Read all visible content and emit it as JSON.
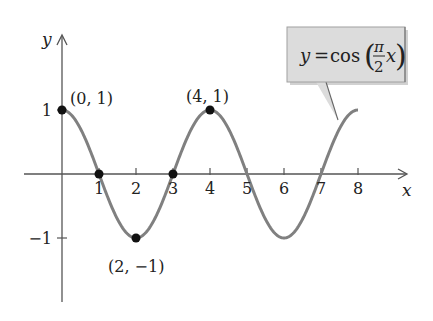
{
  "chart_data": {
    "type": "line",
    "title": "",
    "function_label": {
      "lhs": "y",
      "eq": "=",
      "fn": "cos",
      "frac_num": "π",
      "frac_den": "2",
      "var": "x"
    },
    "xlabel": "x",
    "ylabel": "y",
    "xlim": [
      -1,
      9
    ],
    "ylim": [
      -1.9,
      1.8
    ],
    "x_ticks": [
      1,
      2,
      3,
      4,
      5,
      6,
      7,
      8
    ],
    "x_tick_labels": [
      "1",
      "2",
      "3",
      "4",
      "5",
      "6",
      "7",
      "8"
    ],
    "y_ticks": [
      1,
      -1
    ],
    "y_tick_labels": [
      "1",
      "−1"
    ],
    "grid": false,
    "series": [
      {
        "name": "y = cos(πx/2)",
        "x_range": [
          0,
          8
        ],
        "formula": "cos(pi/2 * x)",
        "color": "#808080"
      }
    ],
    "points": [
      {
        "x": 0,
        "y": 1,
        "label": "(0, 1)"
      },
      {
        "x": 1,
        "y": 0,
        "label": ""
      },
      {
        "x": 2,
        "y": -1,
        "label": "(2, −1)"
      },
      {
        "x": 3,
        "y": 0,
        "label": ""
      },
      {
        "x": 4,
        "y": 1,
        "label": "(4, 1)"
      }
    ],
    "colors": {
      "curve": "#808080",
      "axes": "#555555",
      "points": "#111111",
      "callout_fill": "#dcdcdc",
      "callout_border": "#9a9a9a"
    }
  }
}
